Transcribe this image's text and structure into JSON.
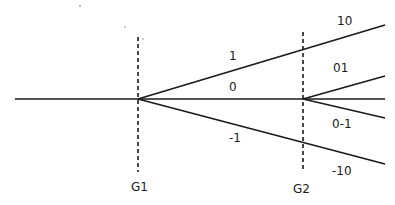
{
  "diagram": {
    "type": "branching-tree",
    "gates": [
      {
        "label": "G1",
        "x": 138
      },
      {
        "label": "G2",
        "x": 303
      }
    ],
    "branches_stage1": [
      {
        "label": "1"
      },
      {
        "label": "0"
      },
      {
        "label": "-1"
      }
    ],
    "branches_stage2": [
      {
        "label": "10"
      },
      {
        "label": "01"
      },
      {
        "label": "0-1"
      },
      {
        "label": "-10"
      }
    ]
  }
}
